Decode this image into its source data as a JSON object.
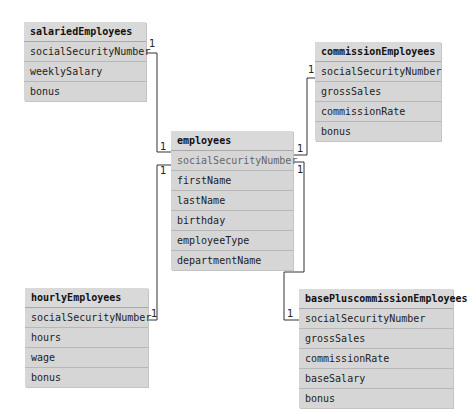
{
  "diagram": {
    "type": "entity-relationship",
    "tables": [
      {
        "id": "salaried",
        "name": "salariedEmployees",
        "fields": [
          "socialSecurityNumber",
          "weeklySalary",
          "bonus"
        ]
      },
      {
        "id": "commission",
        "name": "commissionEmployees",
        "fields": [
          "socialSecurityNumber",
          "grossSales",
          "commissionRate",
          "bonus"
        ]
      },
      {
        "id": "employees",
        "name": "employees",
        "primary_key": "socialSecurityNumber",
        "fields": [
          "socialSecurityNumber",
          "firstName",
          "lastName",
          "birthday",
          "employeeType",
          "departmentName"
        ]
      },
      {
        "id": "hourly",
        "name": "hourlyEmployees",
        "fields": [
          "socialSecurityNumber",
          "hours",
          "wage",
          "bonus"
        ]
      },
      {
        "id": "basePlus",
        "name": "basePluscommissionEmployees",
        "fields": [
          "socialSecurityNumber",
          "grossSales",
          "commissionRate",
          "baseSalary",
          "bonus"
        ]
      }
    ],
    "relationships": [
      {
        "from": "employees",
        "to": "salariedEmployees",
        "from_card": "1",
        "to_card": "1"
      },
      {
        "from": "employees",
        "to": "commissionEmployees",
        "from_card": "1",
        "to_card": "1"
      },
      {
        "from": "employees",
        "to": "hourlyEmployees",
        "from_card": "1",
        "to_card": "1"
      },
      {
        "from": "employees",
        "to": "basePluscommissionEmployees",
        "from_card": "1",
        "to_card": "1"
      }
    ],
    "colors": {
      "box": "#d6d6d6",
      "line": "#333333"
    }
  }
}
